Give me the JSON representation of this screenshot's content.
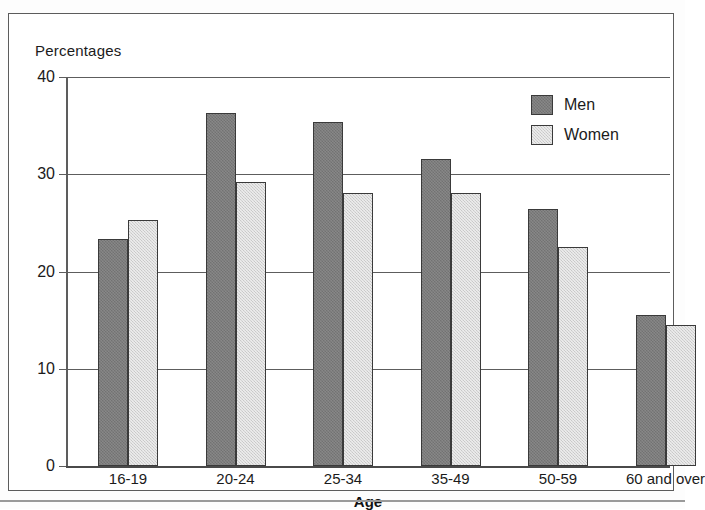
{
  "figure": {
    "y_axis_caption": "Percentages",
    "x_axis_title": "Age"
  },
  "legend": {
    "position": "top-right",
    "entries": [
      {
        "label": "Men",
        "color": "#7b7b7b"
      },
      {
        "label": "Women",
        "color": "#d4d4d4"
      }
    ]
  },
  "axis": {
    "y_ticks": [
      "0",
      "10",
      "20",
      "30",
      "40"
    ]
  },
  "chart_data": {
    "type": "bar",
    "title": "",
    "subtitle": "",
    "xlabel": "Age",
    "ylabel": "Percentages",
    "ylim": [
      0,
      40
    ],
    "ytick_values": [
      0,
      10,
      20,
      30,
      40
    ],
    "grid": true,
    "legend_position": "top-right",
    "categories": [
      "16-19",
      "20-24",
      "25-34",
      "35-49",
      "50-59",
      "60 and over"
    ],
    "series": [
      {
        "name": "Men",
        "color": "#7b7b7b",
        "values": [
          23.3,
          36.3,
          35.4,
          31.6,
          26.4,
          15.5
        ]
      },
      {
        "name": "Women",
        "color": "#d4d4d4",
        "values": [
          25.3,
          29.2,
          28.1,
          28.1,
          22.5,
          14.5
        ]
      }
    ]
  }
}
